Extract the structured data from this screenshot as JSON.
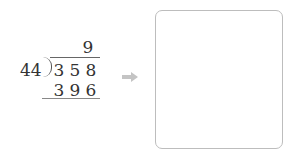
{
  "problem": {
    "quotient": "9",
    "divisor": "44",
    "dividend_digits": [
      "3",
      "5",
      "8"
    ],
    "product_digits": [
      "3",
      "9",
      "6"
    ]
  },
  "arrow": {
    "icon": "right-arrow-icon",
    "color": "#bdbdbd"
  },
  "answer_box": {
    "value": "",
    "border_color": "#bdbdbd"
  }
}
